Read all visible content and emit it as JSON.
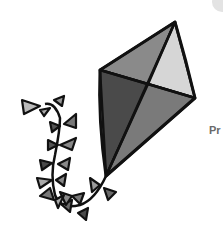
{
  "image": {
    "subject": "Kite with bow-tie tail",
    "colors": {
      "outline": "#111111",
      "panel_top": "#8a8a8a",
      "panel_right": "#d6d6d6",
      "panel_left": "#4a4a4a",
      "panel_bottom": "#7a7a7a",
      "bow_dark": "#5a5a5a",
      "bow_light": "#b5b5b5",
      "corner_shape": "#e3e3e3",
      "edge_text": "#6a6a6a"
    }
  },
  "edge_text": "Pr"
}
